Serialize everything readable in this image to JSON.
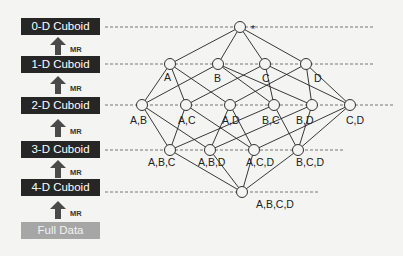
{
  "levels": [
    {
      "label": "0-D Cuboid",
      "y": 27
    },
    {
      "label": "1-D Cuboid",
      "y": 64
    },
    {
      "label": "2-D Cuboid",
      "y": 105
    },
    {
      "label": "3-D Cuboid",
      "y": 150
    },
    {
      "label": "4-D Cuboid",
      "y": 192
    }
  ],
  "base": {
    "label": "Full Data"
  },
  "arrow_label": "MR",
  "colors": {
    "box_dark": "#262626",
    "box_light": "#a6a6a6",
    "line": "#222222",
    "dashed": "#555555"
  },
  "nodes": [
    {
      "id": "*",
      "label": "*",
      "x": 240,
      "y": 27,
      "lx": 251,
      "ly": 33
    },
    {
      "id": "A",
      "label": "A",
      "x": 170,
      "y": 64,
      "lx": 164,
      "ly": 81
    },
    {
      "id": "B",
      "label": "B",
      "x": 218,
      "y": 64,
      "lx": 214,
      "ly": 82
    },
    {
      "id": "C",
      "label": "C",
      "x": 265,
      "y": 64,
      "lx": 262,
      "ly": 82
    },
    {
      "id": "D",
      "label": "D",
      "x": 306,
      "y": 64,
      "lx": 314,
      "ly": 82
    },
    {
      "id": "AB",
      "label": "A,B",
      "x": 142,
      "y": 105,
      "lx": 130,
      "ly": 124
    },
    {
      "id": "AC",
      "label": "A,C",
      "x": 186,
      "y": 105,
      "lx": 178,
      "ly": 124
    },
    {
      "id": "AD",
      "label": "A,D",
      "x": 230,
      "y": 105,
      "lx": 222,
      "ly": 124
    },
    {
      "id": "BC",
      "label": "B,C",
      "x": 274,
      "y": 105,
      "lx": 262,
      "ly": 124
    },
    {
      "id": "BD",
      "label": "B,D",
      "x": 312,
      "y": 105,
      "lx": 296,
      "ly": 124
    },
    {
      "id": "CD",
      "label": "C,D",
      "x": 350,
      "y": 105,
      "lx": 346,
      "ly": 124
    },
    {
      "id": "ABC",
      "label": "A,B,C",
      "x": 170,
      "y": 150,
      "lx": 148,
      "ly": 166
    },
    {
      "id": "ABD",
      "label": "A,B,D",
      "x": 210,
      "y": 150,
      "lx": 198,
      "ly": 166
    },
    {
      "id": "ACD",
      "label": "A,C,D",
      "x": 254,
      "y": 150,
      "lx": 246,
      "ly": 166
    },
    {
      "id": "BCD",
      "label": "B,C,D",
      "x": 298,
      "y": 150,
      "lx": 296,
      "ly": 166
    },
    {
      "id": "ABCD",
      "label": "A,B,C,D",
      "x": 242,
      "y": 192,
      "lx": 256,
      "ly": 208
    }
  ],
  "edges": [
    [
      "*",
      "A"
    ],
    [
      "*",
      "B"
    ],
    [
      "*",
      "C"
    ],
    [
      "*",
      "D"
    ],
    [
      "A",
      "AB"
    ],
    [
      "A",
      "AC"
    ],
    [
      "A",
      "AD"
    ],
    [
      "B",
      "AB"
    ],
    [
      "B",
      "BC"
    ],
    [
      "B",
      "BD"
    ],
    [
      "C",
      "AC"
    ],
    [
      "C",
      "BC"
    ],
    [
      "C",
      "CD"
    ],
    [
      "D",
      "AD"
    ],
    [
      "D",
      "BD"
    ],
    [
      "D",
      "CD"
    ],
    [
      "AB",
      "ABC"
    ],
    [
      "AB",
      "ABD"
    ],
    [
      "AC",
      "ABC"
    ],
    [
      "AC",
      "ACD"
    ],
    [
      "AD",
      "ABD"
    ],
    [
      "AD",
      "ACD"
    ],
    [
      "BC",
      "ABC"
    ],
    [
      "BC",
      "BCD"
    ],
    [
      "BD",
      "ABD"
    ],
    [
      "BD",
      "BCD"
    ],
    [
      "CD",
      "ACD"
    ],
    [
      "CD",
      "BCD"
    ],
    [
      "ABC",
      "ABCD"
    ],
    [
      "ABD",
      "ABCD"
    ],
    [
      "ACD",
      "ABCD"
    ],
    [
      "BCD",
      "ABCD"
    ]
  ],
  "dashed_lines": [
    {
      "y": 27,
      "x1": 105,
      "x2": 375
    },
    {
      "y": 64,
      "x1": 105,
      "x2": 375
    },
    {
      "y": 105,
      "x1": 105,
      "x2": 393
    },
    {
      "y": 150,
      "x1": 105,
      "x2": 343
    },
    {
      "y": 192,
      "x1": 105,
      "x2": 318
    }
  ]
}
